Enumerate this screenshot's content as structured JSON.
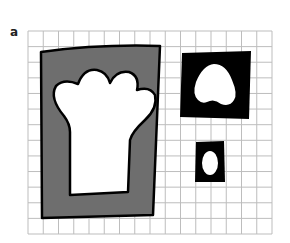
{
  "figure": {
    "panel_label": "a",
    "grid": {
      "x0": 28,
      "y0": 31,
      "x1": 272,
      "y1": 234,
      "cols": 16,
      "rows": 13,
      "color": "#bdbdbd"
    },
    "shapes": [
      {
        "name": "large-gray-panel",
        "fill": "#6e6e6e",
        "cutout": "chef-hat"
      },
      {
        "name": "medium-black-panel",
        "fill": "#000000",
        "cutout": "rounded-triangle"
      },
      {
        "name": "small-black-panel",
        "fill": "#000000",
        "cutout": "egg"
      }
    ],
    "colors": {
      "gray": "#6e6e6e",
      "black": "#000000",
      "white": "#ffffff",
      "outline": "#000000"
    }
  }
}
